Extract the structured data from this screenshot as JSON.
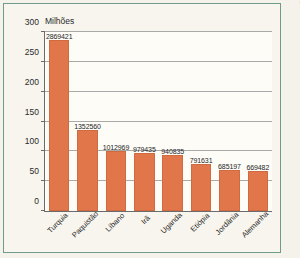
{
  "credit": "Banco de imagens/Arquivo da editora",
  "chart_data": {
    "type": "bar",
    "title": "",
    "ylabel": "Milhões",
    "xlabel": "",
    "ylim": [
      0,
      300
    ],
    "yticks": [
      0,
      50,
      100,
      150,
      200,
      250,
      300
    ],
    "ytick_labels": [
      "0",
      "50",
      "100",
      "150",
      "200",
      "250",
      "300"
    ],
    "grid": true,
    "legend": "none",
    "bar_color": "#e0764a",
    "categories": [
      "Turquia",
      "Paquistão",
      "Líbano",
      "Irã",
      "Uganda",
      "Etiópia",
      "Jordânia",
      "Alemanha"
    ],
    "values": [
      287,
      135,
      101,
      98,
      94,
      79,
      69,
      67
    ],
    "data_labels": [
      "2869421",
      "1352560",
      "1012969",
      "979435",
      "940835",
      "791631",
      "685197",
      "669482"
    ]
  }
}
